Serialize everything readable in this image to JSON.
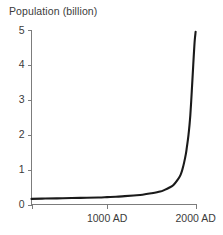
{
  "chart_data": {
    "type": "line",
    "title": "Population (billion)",
    "xlabel": "",
    "ylabel": "Population (billion)",
    "xlim": [
      146,
      2010
    ],
    "ylim": [
      0,
      5
    ],
    "grid": false,
    "legend": false,
    "y_ticks": [
      {
        "value": 5,
        "label": "5"
      },
      {
        "value": 4,
        "label": "4"
      },
      {
        "value": 3,
        "label": "3"
      },
      {
        "value": 2,
        "label": "2"
      },
      {
        "value": 1,
        "label": "1"
      },
      {
        "value": 0,
        "label": "0"
      }
    ],
    "x_ticks": [
      {
        "value": 146,
        "label": ""
      },
      {
        "value": 1000,
        "label": "1000 AD"
      },
      {
        "value": 2000,
        "label": "2000 AD"
      }
    ],
    "series": [
      {
        "name": "World population",
        "color": "#1a1a1a",
        "x": [
          146,
          300,
          500,
          700,
          900,
          1000,
          1100,
          1200,
          1300,
          1400,
          1500,
          1600,
          1650,
          1700,
          1750,
          1800,
          1830,
          1850,
          1870,
          1890,
          1900,
          1910,
          1920,
          1930,
          1940,
          1950,
          1960,
          1970,
          1980,
          1990,
          2000
        ],
        "y": [
          0.16,
          0.17,
          0.18,
          0.19,
          0.2,
          0.21,
          0.22,
          0.24,
          0.26,
          0.28,
          0.32,
          0.37,
          0.42,
          0.48,
          0.56,
          0.72,
          0.85,
          1.0,
          1.2,
          1.45,
          1.62,
          1.8,
          2.0,
          2.25,
          2.55,
          2.95,
          3.4,
          3.85,
          4.3,
          4.7,
          4.95
        ]
      }
    ]
  }
}
